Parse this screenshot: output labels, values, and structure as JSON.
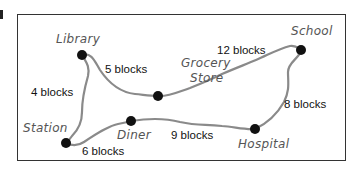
{
  "diagram": {
    "title": "",
    "places": {
      "library": "Library",
      "grocery_line1": "Grocery",
      "grocery_line2": "Store",
      "school": "School",
      "station": "Station",
      "diner": "Diner",
      "hospital": "Hospital"
    },
    "distances": {
      "library_grocery": "5 blocks",
      "grocery_school": "12 blocks",
      "library_station": "4 blocks",
      "school_hospital": "8 blocks",
      "station_diner": "6 blocks",
      "diner_hospital": "9 blocks"
    },
    "edges": [
      {
        "from": "Library",
        "to": "Grocery Store",
        "label": "5 blocks"
      },
      {
        "from": "Grocery Store",
        "to": "School",
        "label": "12 blocks"
      },
      {
        "from": "Library",
        "to": "Station",
        "label": "4 blocks"
      },
      {
        "from": "School",
        "to": "Hospital",
        "label": "8 blocks"
      },
      {
        "from": "Station",
        "to": "Diner",
        "label": "6 blocks"
      },
      {
        "from": "Diner",
        "to": "Hospital",
        "label": "9 blocks"
      }
    ],
    "colors": {
      "road": "#8a8a8a",
      "node": "#111111",
      "frame": "#333333"
    }
  }
}
